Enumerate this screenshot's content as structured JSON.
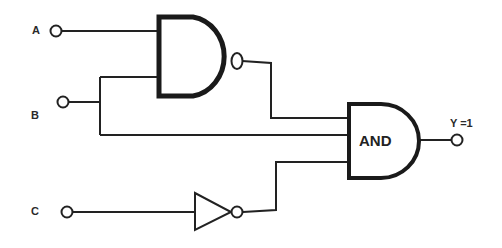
{
  "diagram": {
    "type": "logic-circuit",
    "inputs": [
      {
        "name": "A",
        "label": "A"
      },
      {
        "name": "B",
        "label": "B"
      },
      {
        "name": "C",
        "label": "C"
      }
    ],
    "gates": [
      {
        "id": "g1",
        "type": "NAND",
        "inputs": [
          "A",
          "B"
        ],
        "label": ""
      },
      {
        "id": "g2",
        "type": "NOT",
        "inputs": [
          "C"
        ],
        "label": ""
      },
      {
        "id": "g3",
        "type": "AND",
        "inputs": [
          "g1",
          "B",
          "g2"
        ],
        "label": "AND"
      }
    ],
    "output": {
      "name": "Y",
      "label": "Y =1"
    },
    "colors": {
      "line": "#222222",
      "background": "#ffffff"
    }
  }
}
